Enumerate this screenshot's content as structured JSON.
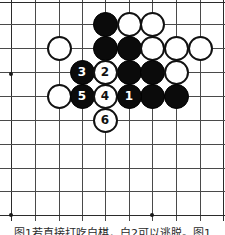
{
  "figure": {
    "caption": "图1若直接打吃白棋，白2可以逃脱。图1"
  },
  "board": {
    "type": "go-board",
    "visible_columns": 10,
    "visible_rows": 10,
    "line_color": "#4a4a4a",
    "background_color": "#ffffff",
    "vertical_line_x": [
      11,
      35,
      59,
      82,
      105,
      129,
      152,
      176,
      200,
      223
    ],
    "horizontal_line_y": [
      2,
      24,
      48,
      72,
      96,
      120,
      144,
      168,
      191,
      215
    ],
    "star_points": [
      {
        "x": 11,
        "y": 74
      },
      {
        "x": 11,
        "y": 215
      },
      {
        "x": 152,
        "y": 215
      }
    ]
  },
  "stones": [
    {
      "id": "w-a",
      "color": "white",
      "label": "",
      "x": 59,
      "y": 48
    },
    {
      "id": "b-b",
      "color": "black",
      "label": "",
      "x": 105,
      "y": 24
    },
    {
      "id": "w-c",
      "color": "white",
      "label": "",
      "x": 129,
      "y": 24
    },
    {
      "id": "w-d",
      "color": "white",
      "label": "",
      "x": 152,
      "y": 24
    },
    {
      "id": "b-e",
      "color": "black",
      "label": "",
      "x": 105,
      "y": 48
    },
    {
      "id": "b-f",
      "color": "black",
      "label": "",
      "x": 129,
      "y": 48
    },
    {
      "id": "w-g",
      "color": "white",
      "label": "",
      "x": 152,
      "y": 48
    },
    {
      "id": "w-h",
      "color": "white",
      "label": "",
      "x": 176,
      "y": 48
    },
    {
      "id": "w-i",
      "color": "white",
      "label": "",
      "x": 200,
      "y": 48
    },
    {
      "id": "w-j",
      "color": "white",
      "label": "",
      "x": 105,
      "y": 72
    },
    {
      "id": "b-k",
      "color": "black",
      "label": "",
      "x": 129,
      "y": 72
    },
    {
      "id": "b-l",
      "color": "black",
      "label": "",
      "x": 152,
      "y": 72
    },
    {
      "id": "w-m",
      "color": "white",
      "label": "",
      "x": 176,
      "y": 72
    },
    {
      "id": "w-n",
      "color": "white",
      "label": "",
      "x": 59,
      "y": 96
    },
    {
      "id": "b-o",
      "color": "black",
      "label": "",
      "x": 152,
      "y": 96
    },
    {
      "id": "b-p",
      "color": "black",
      "label": "",
      "x": 176,
      "y": 96
    },
    {
      "id": "m3",
      "color": "black",
      "label": "3",
      "x": 82,
      "y": 72
    },
    {
      "id": "m2",
      "color": "white",
      "label": "2",
      "x": 105,
      "y": 72
    },
    {
      "id": "m5",
      "color": "black",
      "label": "5",
      "x": 82,
      "y": 96
    },
    {
      "id": "m4",
      "color": "white",
      "label": "4",
      "x": 105,
      "y": 96
    },
    {
      "id": "m1",
      "color": "black",
      "label": "1",
      "x": 129,
      "y": 96
    },
    {
      "id": "m6",
      "color": "white",
      "label": "6",
      "x": 105,
      "y": 120
    }
  ],
  "moves": [
    {
      "number": "1",
      "color": "black"
    },
    {
      "number": "2",
      "color": "white"
    },
    {
      "number": "3",
      "color": "black"
    },
    {
      "number": "4",
      "color": "white"
    },
    {
      "number": "5",
      "color": "black"
    },
    {
      "number": "6",
      "color": "white"
    }
  ]
}
